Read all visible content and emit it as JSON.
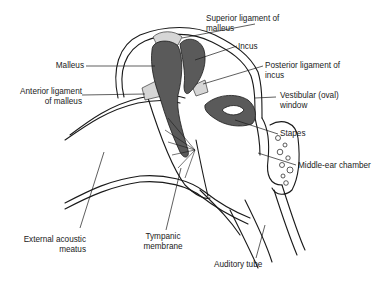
{
  "diagram": {
    "colors": {
      "ossicle_fill": "#5a5a5a",
      "line": "#1a1a1a",
      "background": "#ffffff",
      "ligament": "#cfcfcf"
    },
    "labels": {
      "superior_ligament": "Superior ligament of\nmalleus",
      "incus": "Incus",
      "posterior_ligament": "Posterior ligament of\nincus",
      "malleus": "Malleus",
      "anterior_ligament": "Anterior ligament\nof malleus",
      "vestibular_window": "Vestibular (oval)\nwindow",
      "stapes": "Stapes",
      "middle_ear_chamber": "Middle-ear chamber",
      "external_acoustic_meatus": "External acoustic\nmeatus",
      "tympanic_membrane": "Tympanic\nmembrane",
      "auditory_tube": "Auditory tube"
    }
  }
}
